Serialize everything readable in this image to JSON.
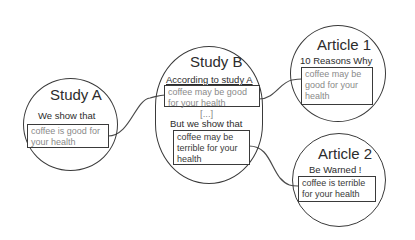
{
  "diagram": {
    "nodes": [
      {
        "id": "study-a",
        "title": "Study A",
        "subtitle": "We show that",
        "claim": "coffee is good for your health"
      },
      {
        "id": "study-b",
        "title": "Study B",
        "subtitle": "According to study A",
        "claim": "coffee may be good for your health",
        "ellipsis": "[...]",
        "subtitle2": "But we show that",
        "claim2": "coffee may be terrible for your health"
      },
      {
        "id": "article-1",
        "title": "Article 1",
        "subtitle": "10 Reasons Why",
        "claim": "coffee may be good for your health"
      },
      {
        "id": "article-2",
        "title": "Article 2",
        "subtitle": "Be Warned !",
        "claim": "coffee is terrible for your health"
      }
    ],
    "links": [
      {
        "from": "study-a",
        "to": "study-b"
      },
      {
        "from": "study-b",
        "to": "article-1"
      },
      {
        "from": "study-b",
        "to": "article-2"
      }
    ]
  }
}
